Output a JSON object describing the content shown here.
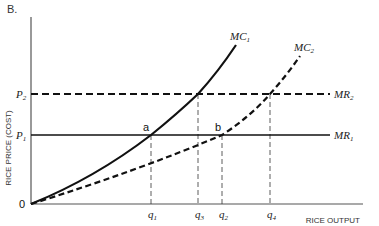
{
  "panel_label": "B.",
  "axes": {
    "y_label": "RICE PRICE (COST)",
    "x_label": "RICE OUTPUT",
    "origin_label": "0"
  },
  "price_levels": [
    {
      "name": "P",
      "sub": "2",
      "line_style": "dashed",
      "line_label": "MR",
      "line_sub": "2"
    },
    {
      "name": "P",
      "sub": "1",
      "line_style": "solid",
      "line_label": "MR",
      "line_sub": "1"
    }
  ],
  "curves": [
    {
      "name": "MC",
      "sub": "1",
      "style": "solid"
    },
    {
      "name": "MC",
      "sub": "2",
      "style": "dashed"
    }
  ],
  "points": [
    {
      "label": "a",
      "desc": "MC1 intersects MR1"
    },
    {
      "label": "b",
      "desc": "MC2 intersects MR1"
    }
  ],
  "quantities": [
    {
      "name": "q",
      "sub": "1"
    },
    {
      "name": "q",
      "sub": "3"
    },
    {
      "name": "q",
      "sub": "2"
    },
    {
      "name": "q",
      "sub": "4"
    }
  ],
  "colors": {
    "line": "#111111",
    "axis": "#555555",
    "guide": "#333333",
    "background": "#ffffff"
  }
}
